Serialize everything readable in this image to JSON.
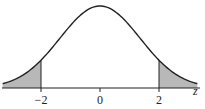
{
  "chart_data": {
    "type": "area",
    "title": "",
    "xlabel": "z",
    "ylabel": "",
    "x_ticks": [
      -2,
      0,
      2
    ],
    "tick_labels": [
      "−2",
      "0",
      "2"
    ],
    "xlim": [
      -3.3,
      3.3
    ],
    "grid": false,
    "legend": null,
    "shaded_regions": [
      {
        "from": "-inf",
        "to": -2,
        "label": "left tail"
      },
      {
        "from": 2,
        "to": "inf",
        "label": "right tail"
      }
    ],
    "critical_values": [
      -2,
      2
    ],
    "colors": {
      "curve": "#222222",
      "shade": "#b8b8b8",
      "axis": "#222222"
    }
  }
}
